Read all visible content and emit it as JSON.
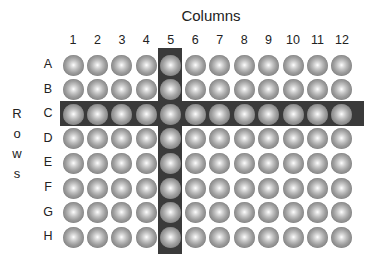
{
  "title": "Columns",
  "axis_label_rows": [
    "R",
    "o",
    "w",
    "s"
  ],
  "columns": [
    "1",
    "2",
    "3",
    "4",
    "5",
    "6",
    "7",
    "8",
    "9",
    "10",
    "11",
    "12"
  ],
  "rows": [
    "A",
    "B",
    "C",
    "D",
    "E",
    "F",
    "G",
    "H"
  ],
  "highlight": {
    "column": "5",
    "row": "C",
    "color": "#3a3a3a"
  },
  "well_color": "#9c9c9c"
}
